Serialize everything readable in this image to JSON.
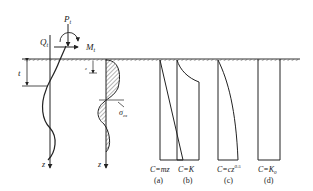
{
  "figure": {
    "loads": {
      "axial_force": "P",
      "axial_force_sub": "t",
      "shear_force": "Q",
      "shear_force_sub": "t",
      "moment": "M",
      "moment_sub": "t"
    },
    "dimension_label": "t",
    "depth_label": "z",
    "depth_small_label": "z",
    "stress_label": "σ",
    "stress_sub": "zx",
    "distributions": [
      {
        "id": "a",
        "formula": "C=mz",
        "caption": "(a)"
      },
      {
        "id": "b",
        "formula": "C=K",
        "caption": "(b)"
      },
      {
        "id": "c",
        "formula": "C=cz",
        "formula_sup": "0.5",
        "caption": "(c)"
      },
      {
        "id": "d",
        "formula": "C=K",
        "formula_sub": "0",
        "caption": "(d)"
      }
    ]
  }
}
